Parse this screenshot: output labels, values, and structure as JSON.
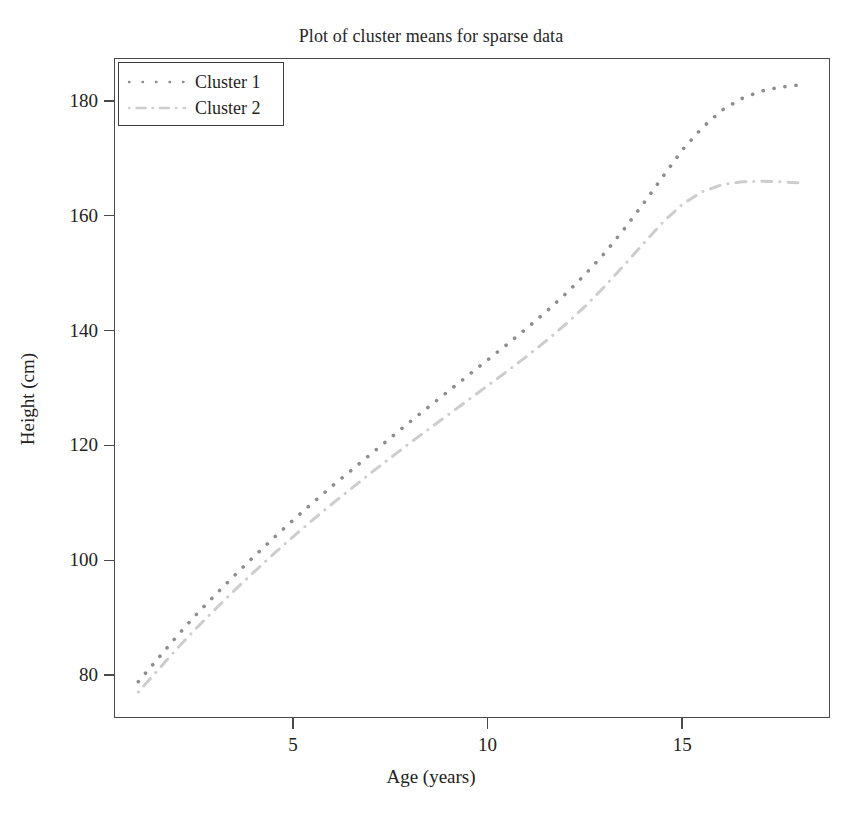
{
  "chart_data": {
    "type": "line",
    "title": "Plot of cluster means for sparse data",
    "xlabel": "Age (years)",
    "ylabel": "Height (cm)",
    "xlim": [
      0.4,
      18.8
    ],
    "ylim": [
      72.5,
      187.5
    ],
    "xticks": [
      5,
      10,
      15
    ],
    "xtick_labels": [
      "5",
      "10",
      "15"
    ],
    "yticks": [
      80,
      100,
      120,
      140,
      160,
      180
    ],
    "ytick_labels": [
      "80",
      "100",
      "120",
      "140",
      "160",
      "180"
    ],
    "grid": false,
    "legend_position": "top-left",
    "x": [
      1.0,
      1.5,
      2.0,
      2.5,
      3.0,
      3.5,
      4.0,
      4.5,
      5.0,
      5.5,
      6.0,
      6.5,
      7.0,
      7.5,
      8.0,
      8.5,
      9.0,
      9.5,
      10.0,
      10.5,
      11.0,
      11.5,
      12.0,
      12.5,
      13.0,
      13.5,
      14.0,
      14.5,
      15.0,
      15.5,
      16.0,
      16.5,
      17.0,
      17.5,
      18.0
    ],
    "series": [
      {
        "name": "Cluster 1",
        "color": "#8d8d8d",
        "linestyle": "dotted",
        "values": [
          79.0,
          83.0,
          87.0,
          90.8,
          94.3,
          97.7,
          101.0,
          104.2,
          107.3,
          110.3,
          113.2,
          116.0,
          118.8,
          121.6,
          124.4,
          127.1,
          129.8,
          132.5,
          135.2,
          137.9,
          140.7,
          143.6,
          146.7,
          150.1,
          153.8,
          158.0,
          162.5,
          167.2,
          171.8,
          175.6,
          178.6,
          180.6,
          181.9,
          182.6,
          183.0
        ]
      },
      {
        "name": "Cluster 2",
        "color": "#cdcdcd",
        "linestyle": "dashdot",
        "values": [
          77.2,
          81.0,
          84.8,
          88.4,
          91.8,
          95.1,
          98.3,
          101.4,
          104.4,
          107.3,
          110.1,
          112.8,
          115.5,
          118.1,
          120.7,
          123.2,
          125.7,
          128.2,
          130.7,
          133.2,
          135.8,
          138.5,
          141.4,
          144.5,
          148.0,
          151.7,
          155.5,
          159.2,
          162.3,
          164.4,
          165.6,
          166.1,
          166.2,
          166.1,
          165.9
        ]
      }
    ]
  },
  "legend": {
    "items": [
      {
        "label": "Cluster 1"
      },
      {
        "label": "Cluster 2"
      }
    ]
  }
}
